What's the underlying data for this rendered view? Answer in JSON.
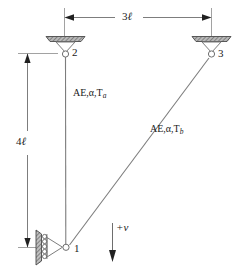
{
  "figure": {
    "background_color": "#ffffff",
    "line_color": "#6e6e6e",
    "text_color": "#1a1a1a",
    "hatch_color": "#7a7a7a"
  },
  "dimensions": {
    "horizontal": {
      "label": "3ℓ",
      "value_text": "3",
      "unit_symbol": "ℓ",
      "from_node": "2",
      "to_node": "3"
    },
    "vertical": {
      "label": "4ℓ",
      "value_text": "4",
      "unit_symbol": "ℓ",
      "from_node": "2",
      "to_node": "1"
    }
  },
  "nodes": [
    {
      "id": "node-1",
      "label": "1",
      "support": "roller-on-vertical-wall",
      "x": 66,
      "y": 247
    },
    {
      "id": "node-2",
      "label": "2",
      "support": "pin",
      "x": 65,
      "y": 53
    },
    {
      "id": "node-3",
      "label": "3",
      "support": "pin",
      "x": 211,
      "y": 53
    }
  ],
  "members": [
    {
      "id": "member-a",
      "label_prefix": "AE,α,T",
      "label_subscript": "a",
      "from": "2",
      "to": "1",
      "orientation": "vertical"
    },
    {
      "id": "member-b",
      "label_prefix": "AE,α,T",
      "label_subscript": "b",
      "from": "3",
      "to": "1",
      "orientation": "diagonal"
    }
  ],
  "sign_convention": {
    "label": "+v",
    "direction": "down",
    "description": "positive displacement v is downward"
  }
}
